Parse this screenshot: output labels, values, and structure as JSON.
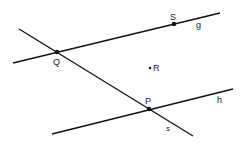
{
  "diagram": {
    "type": "geometry",
    "lines": [
      {
        "name": "g",
        "x1": 13,
        "y1": 63,
        "x2": 220,
        "y2": 13,
        "label": "g",
        "label_x": 196,
        "label_y": 28
      },
      {
        "name": "s",
        "x1": 19,
        "y1": 29,
        "x2": 193,
        "y2": 136,
        "label": "s",
        "label_x": 166,
        "label_y": 131
      },
      {
        "name": "h",
        "x1": 52,
        "y1": 134,
        "x2": 233,
        "y2": 89,
        "label": "h",
        "label_x": 217,
        "label_y": 103
      }
    ],
    "points": [
      {
        "name": "S",
        "x": 174,
        "y": 24,
        "label": "S",
        "label_x": 170,
        "label_y": 20
      },
      {
        "name": "Q",
        "x": 57,
        "y": 52,
        "label": "Q",
        "label_x": 53,
        "label_y": 65
      },
      {
        "name": "R",
        "x": 150,
        "y": 68,
        "label": "R",
        "label_x": 153,
        "label_y": 71
      },
      {
        "name": "P",
        "x": 149,
        "y": 109,
        "label": "P",
        "label_x": 145,
        "label_y": 104
      }
    ]
  }
}
